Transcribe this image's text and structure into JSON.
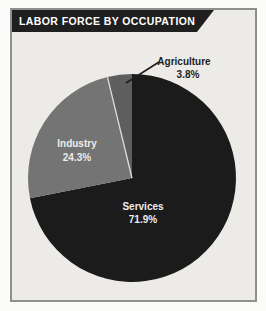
{
  "banner": {
    "title": "LABOR FORCE BY OCCUPATION"
  },
  "colors": {
    "banner_bg": "#1f1f1f",
    "banner_text": "#ffffff",
    "frame_border": "#8f8f8f",
    "frame_bg": "#edebe8",
    "services": "#1b1b1b",
    "industry": "#747474",
    "agriculture": "#5e5e5e",
    "slice_divider": "#dedcd9",
    "leader_line": "#1d1d1d",
    "light_label": "#ececec",
    "dark_label": "#1d1d1d"
  },
  "chart_data": {
    "type": "pie",
    "title": "LABOR FORCE BY OCCUPATION",
    "start_angle_deg": 0,
    "direction": "clockwise",
    "legend": "none",
    "labels_on_slices": true,
    "slices": [
      {
        "label": "Services",
        "value": 71.9,
        "display": "71.9%",
        "color_key": "services",
        "divider_before": false,
        "label_placement": "inside"
      },
      {
        "label": "Industry",
        "value": 24.3,
        "display": "24.3%",
        "color_key": "industry",
        "divider_before": false,
        "label_placement": "inside"
      },
      {
        "label": "Agriculture",
        "value": 3.8,
        "display": "3.8%",
        "color_key": "agriculture",
        "divider_before": true,
        "label_placement": "outside-with-leader-line"
      }
    ]
  }
}
